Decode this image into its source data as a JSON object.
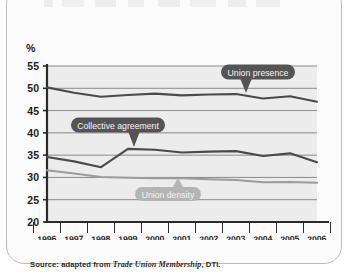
{
  "source": {
    "prefix": "Source: adapted from",
    "title": "Trade Union Membership",
    "suffix": ", DTI."
  },
  "axis": {
    "unit_label": "%",
    "y_ticks": [
      "55",
      "50",
      "45",
      "40",
      "35",
      "30",
      "25",
      "20"
    ],
    "x_ticks": [
      "1996",
      "1997",
      "1998",
      "1999",
      "2000",
      "2001",
      "2002",
      "2003",
      "2004",
      "2005",
      "2006"
    ]
  },
  "callouts": {
    "union_presence": "Union presence",
    "collective_agreement": "Collective agreement",
    "union_density": "Union density"
  },
  "colors": {
    "union_presence": "#4a4a4a",
    "collective_agreement": "#4a4a4a",
    "union_density": "#9b9b9b",
    "callout_dark": "#545454",
    "callout_light": "#b4b4b4",
    "gridline": "#8a8a8a",
    "axis": "#2b2b2b",
    "plot_background": "#ececec",
    "frame_border": "#b9bbbd"
  },
  "chart_data": {
    "type": "line",
    "title": "",
    "subtitle": "",
    "xlabel": "",
    "ylabel": "%",
    "x": [
      1996,
      1997,
      1998,
      1999,
      2000,
      2001,
      2002,
      2003,
      2004,
      2005,
      2006
    ],
    "ylim": [
      20,
      55
    ],
    "xlim": [
      1996,
      2006
    ],
    "y_tick_step": 5,
    "grid": true,
    "legend": "inline-callouts",
    "series": [
      {
        "name": "Union presence",
        "color": "#4a4a4a",
        "values": [
          50.2,
          49.0,
          48.1,
          48.5,
          48.8,
          48.4,
          48.6,
          48.7,
          47.7,
          48.2,
          47.0
        ]
      },
      {
        "name": "Collective agreement",
        "color": "#4a4a4a",
        "values": [
          34.6,
          33.6,
          32.3,
          36.4,
          36.2,
          35.6,
          35.8,
          35.9,
          34.8,
          35.4,
          33.4
        ]
      },
      {
        "name": "Union density",
        "color": "#9b9b9b",
        "values": [
          31.6,
          30.9,
          30.1,
          29.9,
          29.8,
          29.8,
          29.6,
          29.4,
          28.9,
          29.0,
          28.8
        ]
      }
    ]
  }
}
